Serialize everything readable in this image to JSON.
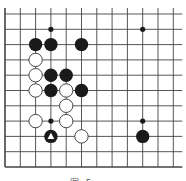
{
  "diagram": {
    "type": "go-board-fragment",
    "grid": {
      "origin_x": 5,
      "origin_y": 14,
      "spacing": 15.3,
      "cols": 12,
      "rows": 11,
      "left_edge": true,
      "bottom_edge": true,
      "top_open": true,
      "right_open": true,
      "line_color": "#444444"
    },
    "markers": [
      {
        "col": 3,
        "row": 1
      },
      {
        "col": 9,
        "row": 1
      },
      {
        "col": 3,
        "row": 7
      },
      {
        "col": 9,
        "row": 7
      }
    ],
    "black_stones": [
      {
        "col": 2,
        "row": 2
      },
      {
        "col": 3,
        "row": 2
      },
      {
        "col": 5,
        "row": 2
      },
      {
        "col": 3,
        "row": 4
      },
      {
        "col": 4,
        "row": 4
      },
      {
        "col": 3,
        "row": 5
      },
      {
        "col": 5,
        "row": 5
      },
      {
        "col": 9,
        "row": 8
      }
    ],
    "black_stones_marked": [
      {
        "col": 3,
        "row": 8,
        "mark": "triangle"
      }
    ],
    "white_stones": [
      {
        "col": 2,
        "row": 3
      },
      {
        "col": 2,
        "row": 4
      },
      {
        "col": 2,
        "row": 5
      },
      {
        "col": 4,
        "row": 5
      },
      {
        "col": 4,
        "row": 6
      },
      {
        "col": 2,
        "row": 7
      },
      {
        "col": 4,
        "row": 7
      },
      {
        "col": 5,
        "row": 8
      }
    ],
    "colors": {
      "black_stone": "#1a1a1a",
      "white_stone": "#ffffff",
      "stone_outline": "#333333",
      "triangle": "#ffffff"
    },
    "caption": "图 5 - 157"
  }
}
